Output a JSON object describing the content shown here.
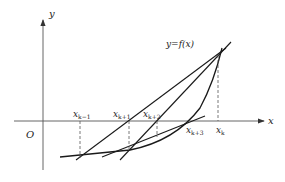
{
  "diagram": {
    "axes": {
      "x_label": "x",
      "y_label": "y",
      "origin_label": "O"
    },
    "curve_label": "y=f(x)",
    "points": [
      {
        "base": "x",
        "sub": "k−1"
      },
      {
        "base": "x",
        "sub": "k+1"
      },
      {
        "base": "x",
        "sub": "k+2"
      },
      {
        "base": "x",
        "sub": "k+3"
      },
      {
        "base": "x",
        "sub": "k"
      }
    ],
    "colors": {
      "stroke": "#1a1a1a",
      "axis": "#555555",
      "dash": "#555555"
    }
  }
}
